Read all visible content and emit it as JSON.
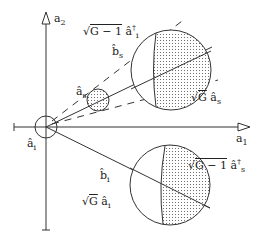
{
  "diagram": {
    "type": "phase-space amplifier diagram",
    "axes": {
      "x_label": "a",
      "x_sub": "1",
      "y_label": "a",
      "y_sub": "2"
    },
    "labels": {
      "idler_input": {
        "base": "â",
        "sub": "i",
        "position": "origin"
      },
      "signal_input": {
        "base": "â",
        "sub": "s"
      },
      "signal_output": {
        "base": "b̂",
        "sub": "s"
      },
      "idler_output": {
        "base": "b̂",
        "sub": "i"
      },
      "upper_term_1": {
        "radical": "√",
        "arg": "G − 1",
        "op": "â",
        "sub": "i",
        "sup": "†"
      },
      "upper_term_2": {
        "radical": "√",
        "arg": "G",
        "op": "â",
        "sub": "s"
      },
      "lower_term_1": {
        "radical": "√",
        "arg": "G − 1",
        "op": "â",
        "sub": "s",
        "sup": "†"
      },
      "lower_term_2": {
        "radical": "√",
        "arg": "G",
        "op": "â",
        "sub": "i"
      }
    },
    "colors": {
      "stroke": "#333333",
      "fill": "#ffffff",
      "dots": "#555555"
    }
  }
}
